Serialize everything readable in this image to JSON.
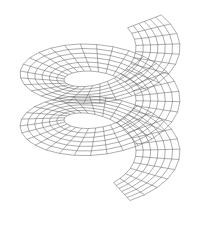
{
  "figure": {
    "background": "#ffffff",
    "line_color": "#4a4a4a",
    "surface": {
      "type": "helical-ribbon",
      "turns": 2.3,
      "u_steps": 70,
      "v_steps": 6,
      "center_x": 100,
      "center_y": 112,
      "radius_x": 80,
      "radius_y": 42,
      "inner_ratio": 0.45,
      "pitch": 52,
      "start_angle_deg": -40
    }
  }
}
